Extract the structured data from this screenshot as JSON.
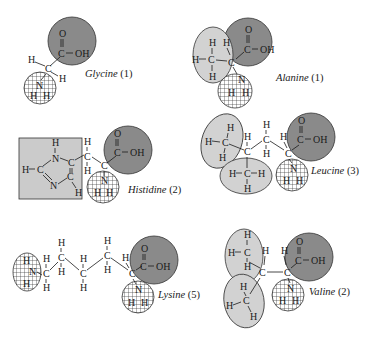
{
  "figure": {
    "type": "amino-acid-structures",
    "legend_groups": {
      "carboxyl_group": {
        "formula": "C(=O)-OH",
        "fill": "#8a8a8a"
      },
      "amino_group": {
        "formula": "NH2",
        "fill": "crosshatch"
      },
      "methyl_group": {
        "formula": "CH3",
        "fill": "#d2d2d2"
      },
      "imidazole_ring": {
        "fill": "#cbcbcb"
      }
    },
    "molecules": [
      {
        "name": "Glycine",
        "count": "(1)",
        "atoms": {
          "O": "O",
          "C": "C",
          "OH": "OH",
          "H": "H",
          "N": "N"
        }
      },
      {
        "name": "Alanine",
        "count": "(1)"
      },
      {
        "name": "Histidine",
        "count": "(2)"
      },
      {
        "name": "Leucine",
        "count": "(3)"
      },
      {
        "name": "Lysine",
        "count": "(5)"
      },
      {
        "name": "Valine",
        "count": "(2)"
      }
    ],
    "atoms": {
      "O": "O",
      "C": "C",
      "OH": "OH",
      "H": "H",
      "N": "N",
      "dbl": "‖",
      "single": "–"
    }
  }
}
